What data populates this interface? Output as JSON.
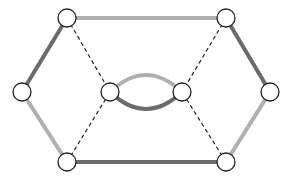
{
  "diagram": {
    "type": "graph",
    "colors": {
      "dark_edge": "#6b6b6b",
      "light_edge": "#b0b0b0",
      "dashed_edge": "#222222",
      "node_stroke": "#222222",
      "node_fill": "#ffffff"
    },
    "nodes": [
      {
        "id": "top-left",
        "x": 67,
        "y": 18
      },
      {
        "id": "top-right",
        "x": 226,
        "y": 18
      },
      {
        "id": "left",
        "x": 22,
        "y": 92
      },
      {
        "id": "inner-left",
        "x": 110,
        "y": 92
      },
      {
        "id": "inner-right",
        "x": 182,
        "y": 92
      },
      {
        "id": "right",
        "x": 270,
        "y": 92
      },
      {
        "id": "bottom-left",
        "x": 67,
        "y": 162
      },
      {
        "id": "bottom-right",
        "x": 226,
        "y": 162
      }
    ],
    "edges": [
      {
        "from": "top-left",
        "to": "top-right",
        "style": "light"
      },
      {
        "from": "top-left",
        "to": "left",
        "style": "dark"
      },
      {
        "from": "top-right",
        "to": "right",
        "style": "dark"
      },
      {
        "from": "left",
        "to": "bottom-left",
        "style": "light"
      },
      {
        "from": "right",
        "to": "bottom-right",
        "style": "light"
      },
      {
        "from": "bottom-left",
        "to": "bottom-right",
        "style": "dark"
      },
      {
        "from": "top-left",
        "to": "inner-left",
        "style": "dashed"
      },
      {
        "from": "top-right",
        "to": "inner-right",
        "style": "dashed"
      },
      {
        "from": "bottom-left",
        "to": "inner-left",
        "style": "dashed"
      },
      {
        "from": "bottom-right",
        "to": "inner-right",
        "style": "dashed"
      },
      {
        "from": "inner-left",
        "to": "inner-right",
        "style": "light",
        "curve": "upper"
      },
      {
        "from": "inner-left",
        "to": "inner-right",
        "style": "dark",
        "curve": "lower"
      }
    ]
  }
}
